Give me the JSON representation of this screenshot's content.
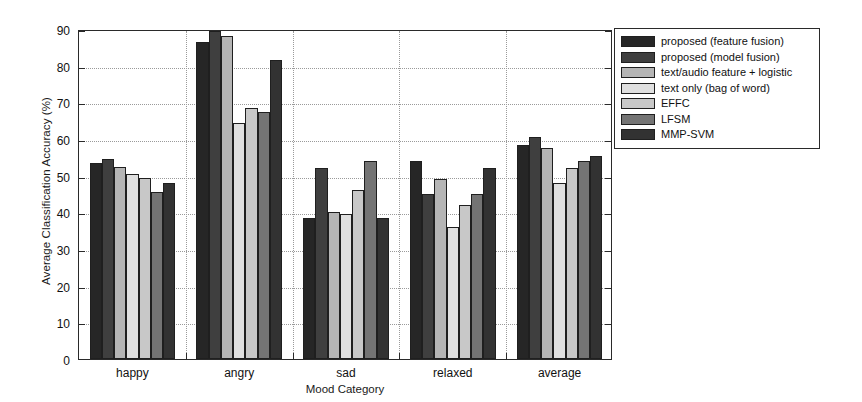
{
  "chart_data": {
    "type": "bar",
    "title": "",
    "xlabel": "Mood Category",
    "ylabel": "Average Classification Accuracy (%)",
    "categories": [
      "happy",
      "angry",
      "sad",
      "relaxed",
      "average"
    ],
    "ylim": [
      0,
      90
    ],
    "yticks": [
      0,
      10,
      20,
      30,
      40,
      50,
      60,
      70,
      80,
      90
    ],
    "grid": true,
    "legend_position": "right-outside",
    "series": [
      {
        "name": "proposed (feature fusion)",
        "color": "#262626",
        "values": [
          53.5,
          86.5,
          38.5,
          54.0,
          58.5
        ]
      },
      {
        "name": "proposed (model fusion)",
        "color": "#3f3f3f",
        "values": [
          54.5,
          89.5,
          52.0,
          45.0,
          60.5
        ]
      },
      {
        "name": "text/audio feature + logistic",
        "color": "#b5b5b5",
        "values": [
          52.5,
          88.0,
          40.0,
          49.0,
          57.5
        ]
      },
      {
        "name": "text only (bag of word)",
        "color": "#e0e0e0",
        "values": [
          50.5,
          64.5,
          39.5,
          36.0,
          48.0
        ]
      },
      {
        "name": "EFFC",
        "color": "#c8c8c8",
        "values": [
          49.5,
          68.5,
          46.0,
          42.0,
          52.0
        ]
      },
      {
        "name": "LFSM",
        "color": "#747474",
        "values": [
          45.5,
          67.5,
          54.0,
          45.0,
          54.0
        ]
      },
      {
        "name": "MMP-SVM",
        "color": "#323232",
        "values": [
          48.0,
          81.5,
          38.5,
          52.0,
          55.5
        ]
      }
    ]
  }
}
